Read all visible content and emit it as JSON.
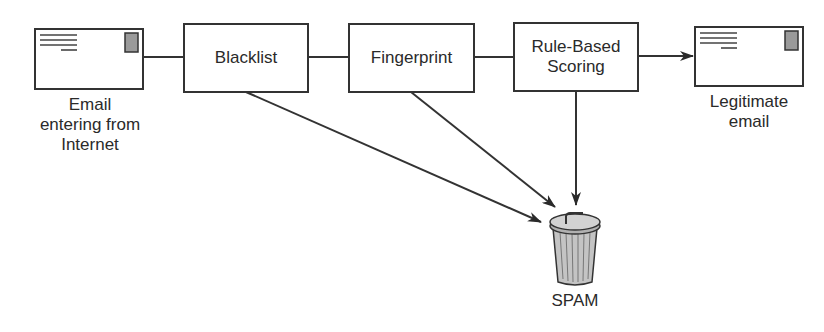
{
  "diagram": {
    "source": {
      "label_lines": [
        "Email",
        "entering from",
        "Internet"
      ],
      "icon": "envelope-icon"
    },
    "stages": [
      {
        "id": "blacklist",
        "label": "Blacklist"
      },
      {
        "id": "fingerprint",
        "label": "Fingerprint"
      },
      {
        "id": "rule_based_scoring",
        "label_lines": [
          "Rule-Based",
          "Scoring"
        ]
      }
    ],
    "destination": {
      "label_lines": [
        "Legitimate",
        "email"
      ],
      "icon": "envelope-icon"
    },
    "spam": {
      "label": "SPAM",
      "icon": "trash-can-icon"
    },
    "edges": [
      {
        "from": "source",
        "to": "blacklist",
        "style": "line"
      },
      {
        "from": "blacklist",
        "to": "fingerprint",
        "style": "line"
      },
      {
        "from": "fingerprint",
        "to": "rule_based_scoring",
        "style": "line"
      },
      {
        "from": "rule_based_scoring",
        "to": "destination",
        "style": "arrow"
      },
      {
        "from": "blacklist",
        "to": "spam",
        "style": "arrow"
      },
      {
        "from": "fingerprint",
        "to": "spam",
        "style": "arrow"
      },
      {
        "from": "rule_based_scoring",
        "to": "spam",
        "style": "arrow"
      }
    ],
    "colors": {
      "stroke": "#333333",
      "stamp": "#9a9a9a",
      "can": "#b8b8b8",
      "text": "#2a2a2a"
    }
  }
}
